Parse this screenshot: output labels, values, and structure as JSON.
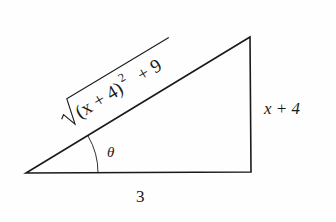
{
  "diagram": {
    "type": "right-triangle",
    "labels": {
      "hypotenuse_radicand": "(x + 4)",
      "hypotenuse_exponent": "2",
      "hypotenuse_tail": "+ 9",
      "opposite": "x + 4",
      "adjacent": "3",
      "angle": "θ"
    },
    "colors": {
      "stroke": "#1a1a1a",
      "background": "#fefefe"
    }
  }
}
